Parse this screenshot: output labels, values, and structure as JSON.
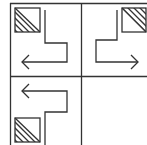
{
  "diagram": {
    "type": "grid-of-path-tiles",
    "colors": {
      "stroke": "#333333",
      "background": "#ffffff"
    },
    "cells": [
      {
        "id": "top-left",
        "hatched_corner": "top-left",
        "hatch_region": "lower-left-triangle",
        "arrow_direction": "left",
        "path": "down-right-down-left"
      },
      {
        "id": "top-right",
        "hatched_corner": "top-right",
        "hatch_region": "upper-right-triangle",
        "arrow_direction": "right",
        "path": "down-left-down-right"
      },
      {
        "id": "bottom-left",
        "hatched_corner": "bottom-left",
        "hatch_region": "lower-left-triangle",
        "arrow_direction": "left",
        "path": "up-right-up-left"
      },
      {
        "id": "bottom-right",
        "empty": true
      }
    ]
  }
}
